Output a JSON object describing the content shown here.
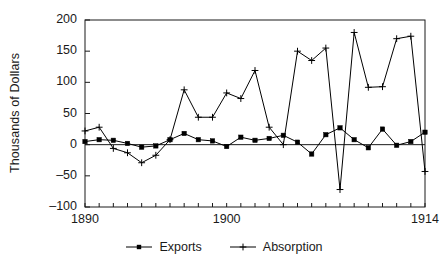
{
  "chart_data": {
    "type": "line",
    "title": "",
    "xlabel": "",
    "ylabel": "Thousands of Dollars",
    "xlim": [
      1890,
      1914
    ],
    "ylim": [
      -100,
      200
    ],
    "yticks": [
      200,
      150,
      100,
      50,
      0,
      -50,
      -100
    ],
    "ytick_labels": [
      "200",
      "150",
      "100",
      "50",
      "0",
      "–50",
      "–100"
    ],
    "xticks": [
      1890,
      1900,
      1914
    ],
    "xtick_labels": [
      "1890",
      "1900",
      "1914"
    ],
    "grid": false,
    "legend_position": "bottom-center",
    "x": [
      1890,
      1891,
      1892,
      1893,
      1894,
      1895,
      1896,
      1897,
      1898,
      1899,
      1900,
      1901,
      1902,
      1903,
      1904,
      1905,
      1906,
      1907,
      1908,
      1909,
      1910,
      1911,
      1912,
      1913,
      1914
    ],
    "series": [
      {
        "name": "Exports",
        "marker": "square",
        "color": "#000000",
        "values": [
          5,
          8,
          7,
          2,
          -4,
          -2,
          8,
          18,
          8,
          6,
          -3,
          12,
          7,
          10,
          15,
          4,
          -15,
          16,
          27,
          8,
          -5,
          25,
          -1,
          5,
          20
        ]
      },
      {
        "name": "Absorption",
        "marker": "plus",
        "color": "#000000",
        "values": [
          22,
          28,
          -6,
          -13,
          -29,
          -17,
          8,
          88,
          44,
          44,
          83,
          74,
          119,
          28,
          0,
          150,
          135,
          155,
          -72,
          180,
          92,
          93,
          170,
          174,
          -43
        ]
      }
    ]
  },
  "legend": {
    "entries": [
      {
        "label": "Exports",
        "marker": "square"
      },
      {
        "label": "Absorption",
        "marker": "plus"
      }
    ]
  },
  "axis": {
    "ylabel": "Thousands of Dollars"
  }
}
